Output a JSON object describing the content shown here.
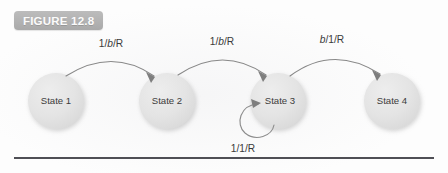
{
  "figure": {
    "badge_label": "FIGURE 12.8",
    "badge_color": "#b2b2b2",
    "badge_text_color": "#fbfbfb",
    "background_color": "#fdfdfd",
    "rule_color": "#4f4f55"
  },
  "diagram": {
    "type": "state-transition-diagram",
    "node_fill": "#e3e3e3",
    "node_text_color": "#3b3b3b",
    "edge_color": "#888888",
    "nodes": [
      {
        "id": "state1",
        "label": "State 1",
        "cx": 56,
        "cy": 101,
        "r": 28
      },
      {
        "id": "state2",
        "label": "State 2",
        "cx": 167,
        "cy": 101,
        "r": 28
      },
      {
        "id": "state3",
        "label": "State 3",
        "cx": 278,
        "cy": 101,
        "r": 28
      },
      {
        "id": "state4",
        "label": "State 4",
        "cx": 392,
        "cy": 101,
        "r": 28
      }
    ],
    "transitions": [
      {
        "id": "t1",
        "from": "State 1",
        "to": "State 2",
        "label": "1/b/R",
        "label_x": 111,
        "label_y": 47
      },
      {
        "id": "t2",
        "from": "State 2",
        "to": "State 3",
        "label": "1/b/R",
        "label_x": 222,
        "label_y": 45
      },
      {
        "id": "t3",
        "from": "State 3",
        "to": "State 4",
        "label": "b/1/R",
        "label_x": 332,
        "label_y": 43
      },
      {
        "id": "t4",
        "from": "State 3",
        "to": "State 3",
        "label": "1/1/R",
        "label_x": 243,
        "label_y": 152
      }
    ]
  }
}
